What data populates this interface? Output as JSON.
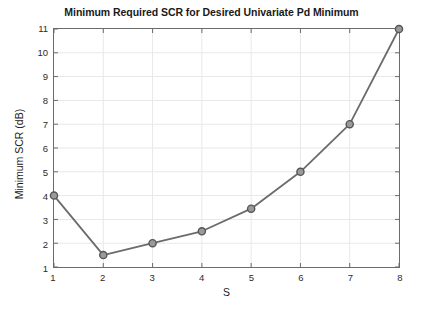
{
  "chart_data": {
    "type": "line",
    "title": "Minimum Required SCR for Desired Univariate Pd Minimum",
    "xlabel": "S",
    "ylabel": "Minimum SCR (dB)",
    "xlim": [
      1,
      8
    ],
    "ylim": [
      1,
      11
    ],
    "xticks": [
      1,
      2,
      3,
      4,
      5,
      6,
      7,
      8
    ],
    "yticks": [
      1,
      2,
      3,
      4,
      5,
      6,
      7,
      8,
      9,
      10,
      11
    ],
    "xtick_labels": [
      "1",
      "2",
      "3",
      "4",
      "5",
      "6",
      "7",
      "8"
    ],
    "ytick_labels": [
      "1",
      "2",
      "3",
      "4",
      "5",
      "6",
      "7",
      "8",
      "9",
      "10",
      "11"
    ],
    "grid": true,
    "legend": null,
    "x": [
      1,
      2,
      3,
      4,
      5,
      6,
      7,
      8
    ],
    "values": [
      4.0,
      1.5,
      2.0,
      2.5,
      3.45,
      5.0,
      7.0,
      11.0
    ],
    "series": [
      {
        "name": "Minimum Required SCR",
        "x": [
          1,
          2,
          3,
          4,
          5,
          6,
          7,
          8
        ],
        "values": [
          4.0,
          1.5,
          2.0,
          2.5,
          3.45,
          5.0,
          7.0,
          11.0
        ]
      }
    ],
    "colors": {
      "line": "#6b6b6b",
      "marker_face": "#9a9a9a",
      "marker_edge": "#555555",
      "grid": "#e8e8e8",
      "axis": "#6b6b6b",
      "text": "#1a1a1a"
    }
  }
}
